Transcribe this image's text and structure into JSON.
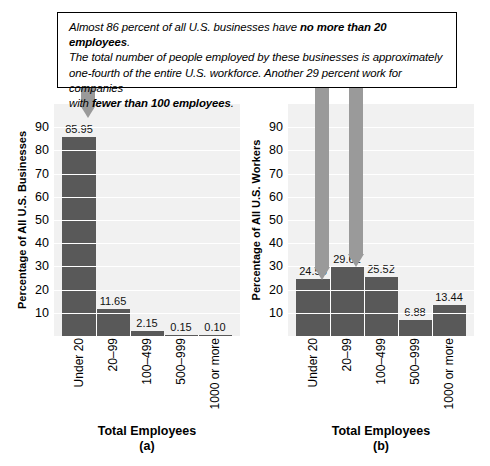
{
  "callout": {
    "line1_a": "Almost 86 percent of all U.S. businesses have ",
    "line1_b": "no more than 20 employees",
    "line1_c": ".",
    "line2": "The total number of people employed by these businesses is approximately",
    "line3": "one-fourth of the entire U.S. workforce. Another 29 percent work for companies",
    "line4_a": "with ",
    "line4_b": "fewer than 100 employees",
    "line4_c": "."
  },
  "colors": {
    "bar": "#595959",
    "arrow": "#9a9a9a",
    "plot_bg": "#f1f1f1",
    "grid": "#ffffff",
    "border": "#000000"
  },
  "yticks": [
    "90",
    "80",
    "70",
    "60",
    "50",
    "40",
    "30",
    "20",
    "10"
  ],
  "chart_data": [
    {
      "type": "bar",
      "id": "a",
      "title": "",
      "ylabel": "Percentage of All U.S. Businesses",
      "xlabel": "Total Employees",
      "caption": "(a)",
      "categories": [
        "Under 20",
        "20–99",
        "100–499",
        "500–999",
        "1000 or more"
      ],
      "values": [
        85.95,
        11.65,
        2.15,
        0.15,
        0.1
      ],
      "value_labels": [
        "85.95",
        "11.65",
        "2.15",
        "0.15",
        "0.10"
      ],
      "ylim": [
        0,
        100
      ],
      "ytick_step": 10,
      "grid": true,
      "legend": "none"
    },
    {
      "type": "bar",
      "id": "b",
      "title": "",
      "ylabel": "Percentage of All U.S. Workers",
      "xlabel": "Total Employees",
      "caption": "(b)",
      "categories": [
        "Under 20",
        "20–99",
        "100–499",
        "500–999",
        "1000 or more"
      ],
      "values": [
        24.55,
        29.61,
        25.52,
        6.88,
        13.44
      ],
      "value_labels": [
        "24.55",
        "29.61",
        "25.52",
        "6.88",
        "13.44"
      ],
      "ylim": [
        0,
        100
      ],
      "ytick_step": 10,
      "grid": true,
      "legend": "none"
    }
  ],
  "annotations": {
    "arrows": [
      {
        "name": "arrow-to-businesses-under-20",
        "target_chart": "a",
        "target_category": "Under 20"
      },
      {
        "name": "arrow-to-workers-under-20",
        "target_chart": "b",
        "target_category": "Under 20"
      },
      {
        "name": "arrow-to-workers-20-99",
        "target_chart": "b",
        "target_category": "20–99"
      }
    ]
  }
}
